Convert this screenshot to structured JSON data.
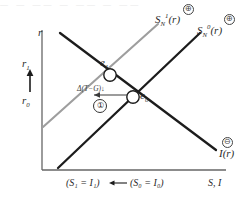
{
  "figure": {
    "type": "economics-diagram",
    "top_crop_artifact": "— —  ——  — —— —  ——"
  },
  "axes": {
    "y_label": "r",
    "x_label": "S, I",
    "y_ticks": [
      {
        "id": "r1",
        "label": "r",
        "sub": "1"
      },
      {
        "id": "r0",
        "label": "r",
        "sub": "0"
      }
    ],
    "y_arrow_direction": "up",
    "x_equilibria": [
      {
        "id": "x1",
        "text": "(S₁ = I₁)"
      },
      {
        "id": "x0",
        "text": "(S₀ = I₀)"
      }
    ],
    "x_arrow_direction": "left"
  },
  "curves": [
    {
      "id": "s1",
      "name": "S",
      "sub": "N",
      "sup": "1",
      "arg": "(r)",
      "sign": "⊕",
      "color": "#9a9a9a",
      "slope": "upward",
      "description": "New national savings curve after shift"
    },
    {
      "id": "s0",
      "name": "S",
      "sub": "N",
      "sup": "0",
      "arg": "(r)",
      "sign": "⊕",
      "color": "#1c1c1c",
      "slope": "upward",
      "description": "Initial national savings curve"
    },
    {
      "id": "ir",
      "name": "I",
      "sub": "",
      "sup": "",
      "arg": "(r)",
      "sign": "⊖",
      "color": "#1c1c1c",
      "slope": "downward",
      "description": "Investment demand curve"
    }
  ],
  "points": [
    {
      "id": "e1",
      "label": "e",
      "sub": "1",
      "x": 110,
      "y": 75
    },
    {
      "id": "e0",
      "label": "e",
      "sub": "0",
      "x": 133,
      "y": 97
    }
  ],
  "annotations": {
    "shift_label": "Δ(T−G)↓",
    "step_number": "①",
    "shift_arrow_direction": "left"
  },
  "colors": {
    "axis": "#555555",
    "curve_dark": "#1c1c1c",
    "curve_gray": "#9a9a9a",
    "text": "#2b2b2b",
    "background": "#ffffff"
  }
}
